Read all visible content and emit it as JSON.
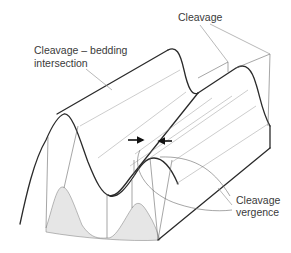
{
  "figure": {
    "type": "block-diagram",
    "labels": {
      "intersection_line1": "Cleavage – bedding",
      "intersection_line2": "intersection",
      "cleavage": "Cleavage",
      "vergence_line1": "Cleavage",
      "vergence_line2": "vergence"
    },
    "colors": {
      "line": "#2a2a2a",
      "thin_line": "#6a6a6a",
      "shade": "#e6e6e6",
      "text": "#3a3a3a",
      "background": "#ffffff"
    },
    "arrows": {
      "count": 2,
      "meaning": "opposing arrows indicating cleavage vergence across the antiform hinge"
    }
  }
}
